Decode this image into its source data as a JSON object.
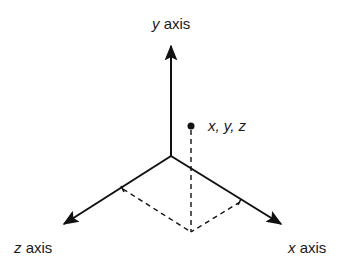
{
  "diagram": {
    "type": "3d-coordinate-axes",
    "labels": {
      "y_axis": {
        "var": "y",
        "word": " axis"
      },
      "z_axis": {
        "var": "z",
        "word": " axis"
      },
      "x_axis": {
        "var": "x",
        "word": " axis"
      },
      "point": {
        "x": "x",
        "sep1": ", ",
        "y": "y",
        "sep2": ", ",
        "z": "z"
      }
    },
    "colors": {
      "stroke": "#111111",
      "text": "#1a1a1a",
      "background": "#ffffff"
    }
  }
}
